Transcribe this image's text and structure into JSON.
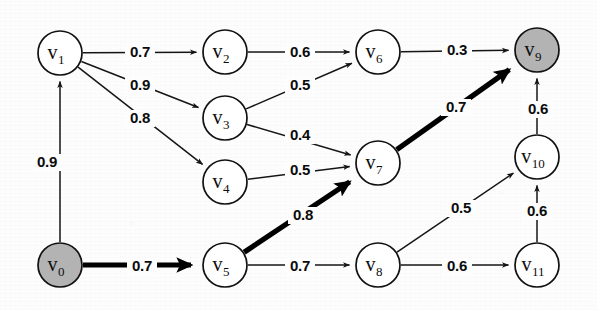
{
  "figure": {
    "background_color": "#fdfdfd",
    "node_fill": "#ffffff",
    "node_shaded_fill": "#b3b3b3",
    "stroke_color": "#151515",
    "highlight_color": "#000000"
  },
  "chart_data": {
    "type": "diagram",
    "subtype": "weighted-directed-graph",
    "title": "",
    "directed": true,
    "node_radius": 22,
    "nodes": [
      {
        "id": "v0",
        "label": "v",
        "sub": "0",
        "x": 60,
        "y": 265,
        "shaded": true
      },
      {
        "id": "v1",
        "label": "v",
        "sub": "1",
        "x": 60,
        "y": 53,
        "shaded": false
      },
      {
        "id": "v2",
        "label": "v",
        "sub": "2",
        "x": 225,
        "y": 52,
        "shaded": false
      },
      {
        "id": "v3",
        "label": "v",
        "sub": "3",
        "x": 225,
        "y": 118,
        "shaded": false
      },
      {
        "id": "v4",
        "label": "v",
        "sub": "4",
        "x": 225,
        "y": 182,
        "shaded": false
      },
      {
        "id": "v5",
        "label": "v",
        "sub": "5",
        "x": 225,
        "y": 265,
        "shaded": false
      },
      {
        "id": "v6",
        "label": "v",
        "sub": "6",
        "x": 378,
        "y": 52,
        "shaded": false
      },
      {
        "id": "v7",
        "label": "v",
        "sub": "7",
        "x": 378,
        "y": 163,
        "shaded": false
      },
      {
        "id": "v8",
        "label": "v",
        "sub": "8",
        "x": 378,
        "y": 265,
        "shaded": false
      },
      {
        "id": "v9",
        "label": "v",
        "sub": "9",
        "x": 537,
        "y": 50,
        "shaded": true
      },
      {
        "id": "v10",
        "label": "v",
        "sub": "10",
        "x": 537,
        "y": 157,
        "shaded": false
      },
      {
        "id": "v11",
        "label": "v",
        "sub": "11",
        "x": 537,
        "y": 265,
        "shaded": false
      }
    ],
    "edges": [
      {
        "from": "v0",
        "to": "v1",
        "weight": "0.9",
        "bold": false,
        "lx": 47,
        "ly": 167
      },
      {
        "from": "v1",
        "to": "v2",
        "weight": "0.7",
        "bold": false,
        "lx": 140,
        "ly": 57
      },
      {
        "from": "v1",
        "to": "v3",
        "weight": "0.9",
        "bold": false,
        "lx": 140,
        "ly": 90
      },
      {
        "from": "v1",
        "to": "v4",
        "weight": "0.8",
        "bold": false,
        "lx": 140,
        "ly": 123
      },
      {
        "from": "v2",
        "to": "v6",
        "weight": "0.6",
        "bold": false,
        "lx": 300,
        "ly": 57
      },
      {
        "from": "v3",
        "to": "v6",
        "weight": "0.5",
        "bold": false,
        "lx": 300,
        "ly": 90
      },
      {
        "from": "v3",
        "to": "v7",
        "weight": "0.4",
        "bold": false,
        "lx": 300,
        "ly": 140
      },
      {
        "from": "v4",
        "to": "v7",
        "weight": "0.5",
        "bold": false,
        "lx": 300,
        "ly": 175
      },
      {
        "from": "v5",
        "to": "v7",
        "weight": "0.8",
        "bold": true,
        "lx": 303,
        "ly": 220
      },
      {
        "from": "v6",
        "to": "v9",
        "weight": "0.3",
        "bold": false,
        "lx": 457,
        "ly": 55
      },
      {
        "from": "v7",
        "to": "v9",
        "weight": "0.7",
        "bold": true,
        "lx": 456,
        "ly": 112
      },
      {
        "from": "v0",
        "to": "v5",
        "weight": "0.7",
        "bold": true,
        "lx": 142,
        "ly": 271
      },
      {
        "from": "v5",
        "to": "v8",
        "weight": "0.7",
        "bold": false,
        "lx": 300,
        "ly": 271
      },
      {
        "from": "v8",
        "to": "v10",
        "weight": "0.5",
        "bold": false,
        "lx": 461,
        "ly": 213
      },
      {
        "from": "v8",
        "to": "v11",
        "weight": "0.6",
        "bold": false,
        "lx": 457,
        "ly": 271
      },
      {
        "from": "v11",
        "to": "v10",
        "weight": "0.6",
        "bold": false,
        "lx": 537,
        "ly": 216
      },
      {
        "from": "v10",
        "to": "v9",
        "weight": "0.6",
        "bold": false,
        "lx": 538,
        "ly": 114
      }
    ],
    "highlighted_path": [
      "v0",
      "v5",
      "v7",
      "v9"
    ],
    "shaded_nodes": [
      "v0",
      "v9"
    ]
  }
}
